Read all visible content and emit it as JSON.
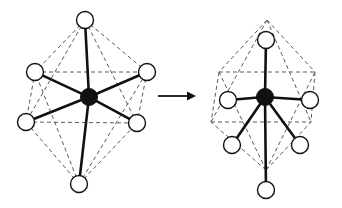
{
  "figure": {
    "background_color": "#ffffff",
    "width": 342,
    "height": 208,
    "bond_color": "#111111",
    "cage_color": "#5a5a5a",
    "ligand_fill": "#ffffff",
    "center_fill": "#111111"
  },
  "arrow": {
    "name": "reaction-arrow",
    "label": "",
    "x1": 158,
    "y1": 96,
    "x2": 196,
    "y2": 96,
    "head_length": 9,
    "head_half_width": 4.5
  },
  "left_structure": {
    "name": "octahedral-complex",
    "label": "",
    "center": {
      "cx": 89,
      "cy": 97,
      "r": 8.5
    },
    "ligands": [
      {
        "id": "axial-top",
        "cx": 85,
        "cy": 20,
        "r": 8.5
      },
      {
        "id": "equatorial-upper-left",
        "cx": 35,
        "cy": 72,
        "r": 8.5
      },
      {
        "id": "equatorial-upper-right",
        "cx": 147,
        "cy": 72,
        "r": 8.5
      },
      {
        "id": "equatorial-lower-left",
        "cx": 26,
        "cy": 122,
        "r": 8.5
      },
      {
        "id": "equatorial-lower-right",
        "cx": 137,
        "cy": 123,
        "r": 8.5
      },
      {
        "id": "axial-bottom",
        "cx": 79,
        "cy": 184,
        "r": 8.5
      }
    ],
    "bonds": [
      {
        "from": "center",
        "to": "axial-top"
      },
      {
        "from": "center",
        "to": "equatorial-upper-left"
      },
      {
        "from": "center",
        "to": "equatorial-upper-right"
      },
      {
        "from": "center",
        "to": "equatorial-lower-left"
      },
      {
        "from": "center",
        "to": "equatorial-lower-right"
      },
      {
        "from": "center",
        "to": "axial-bottom"
      }
    ],
    "cage_edges": [
      {
        "from": "axial-top",
        "to": "equatorial-upper-left"
      },
      {
        "from": "axial-top",
        "to": "equatorial-upper-right"
      },
      {
        "from": "axial-top",
        "to": "equatorial-lower-left"
      },
      {
        "from": "axial-top",
        "to": "equatorial-lower-right"
      },
      {
        "from": "axial-bottom",
        "to": "equatorial-upper-left"
      },
      {
        "from": "axial-bottom",
        "to": "equatorial-upper-right"
      },
      {
        "from": "axial-bottom",
        "to": "equatorial-lower-left"
      },
      {
        "from": "axial-bottom",
        "to": "equatorial-lower-right"
      },
      {
        "from": "equatorial-upper-left",
        "to": "equatorial-upper-right"
      },
      {
        "from": "equatorial-lower-left",
        "to": "equatorial-lower-right"
      },
      {
        "from": "equatorial-upper-left",
        "to": "equatorial-lower-left"
      },
      {
        "from": "equatorial-upper-right",
        "to": "equatorial-lower-right"
      }
    ]
  },
  "right_structure": {
    "name": "distorted-complex",
    "label": "",
    "center": {
      "cx": 265,
      "cy": 97,
      "r": 8.5
    },
    "ligands": [
      {
        "id": "axial-top",
        "cx": 266,
        "cy": 40,
        "r": 8.5
      },
      {
        "id": "equatorial-upper-left",
        "cx": 228,
        "cy": 100,
        "r": 8.5
      },
      {
        "id": "equatorial-upper-right",
        "cx": 310,
        "cy": 100,
        "r": 8.5
      },
      {
        "id": "equatorial-lower-left",
        "cx": 232,
        "cy": 145,
        "r": 8.5
      },
      {
        "id": "equatorial-lower-right",
        "cx": 300,
        "cy": 145,
        "r": 8.5
      },
      {
        "id": "axial-bottom",
        "cx": 266,
        "cy": 190,
        "r": 8.5
      }
    ],
    "cage_vertices": [
      {
        "id": "apex-top",
        "cx": 267,
        "cy": 20
      },
      {
        "id": "vertex-upper-left",
        "cx": 219,
        "cy": 72
      },
      {
        "id": "vertex-upper-right",
        "cx": 315,
        "cy": 72
      },
      {
        "id": "vertex-lower-left",
        "cx": 211,
        "cy": 122
      },
      {
        "id": "vertex-lower-right",
        "cx": 311,
        "cy": 122
      },
      {
        "id": "apex-bottom",
        "cx": 266,
        "cy": 170
      }
    ],
    "bonds": [
      {
        "from": "center",
        "to": "axial-top"
      },
      {
        "from": "center",
        "to": "equatorial-upper-left"
      },
      {
        "from": "center",
        "to": "equatorial-upper-right"
      },
      {
        "from": "center",
        "to": "equatorial-lower-left"
      },
      {
        "from": "center",
        "to": "equatorial-lower-right"
      },
      {
        "from": "center",
        "to": "axial-bottom"
      }
    ],
    "cage_edges": [
      {
        "from": "apex-top",
        "to": "vertex-upper-left"
      },
      {
        "from": "apex-top",
        "to": "vertex-upper-right"
      },
      {
        "from": "apex-top",
        "to": "vertex-lower-left"
      },
      {
        "from": "apex-top",
        "to": "vertex-lower-right"
      },
      {
        "from": "apex-bottom",
        "to": "vertex-upper-left"
      },
      {
        "from": "apex-bottom",
        "to": "vertex-upper-right"
      },
      {
        "from": "apex-bottom",
        "to": "vertex-lower-left"
      },
      {
        "from": "apex-bottom",
        "to": "vertex-lower-right"
      },
      {
        "from": "vertex-upper-left",
        "to": "vertex-upper-right"
      },
      {
        "from": "vertex-lower-left",
        "to": "vertex-lower-right"
      },
      {
        "from": "vertex-upper-left",
        "to": "vertex-lower-left"
      },
      {
        "from": "vertex-upper-right",
        "to": "vertex-lower-right"
      }
    ]
  }
}
